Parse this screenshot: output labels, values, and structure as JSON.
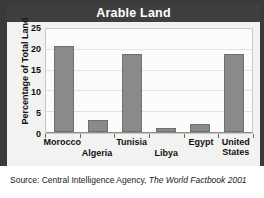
{
  "figure": {
    "title": "Arable Land",
    "source_prefix": "Source: Central Intelligence Agency,",
    "source_publication": "The World Factbook 2001",
    "title_bar_color": "#3f3f3f",
    "frame_color": "#3a3a3a",
    "bar_color": "#8a8a8a",
    "plot_background": "#fcfcfb",
    "panel_background": "#f2f2f0"
  },
  "chart_data": {
    "type": "bar",
    "title": "Arable Land",
    "categories": [
      "Morocco",
      "Algeria",
      "Tunisia",
      "Libya",
      "Egypt",
      "United States"
    ],
    "category_label_lines": [
      [
        "Morocco"
      ],
      [
        "Algeria"
      ],
      [
        "Tunisia"
      ],
      [
        "Libya"
      ],
      [
        "Egypt"
      ],
      [
        "United",
        "States"
      ]
    ],
    "category_label_row": [
      0,
      1,
      0,
      1,
      0,
      0
    ],
    "values": [
      21,
      3,
      19,
      1,
      2,
      19
    ],
    "xlabel": "",
    "ylabel": "Percentage of Total Land",
    "ylim": [
      0,
      25
    ],
    "yticks": [
      0,
      5,
      10,
      15,
      20,
      25
    ],
    "ytick_labels": [
      "0",
      "5",
      "10",
      "15",
      "20",
      "25"
    ],
    "grid": true,
    "grid_axis": "y",
    "legend": false,
    "series_color": "#8a8a8a"
  }
}
